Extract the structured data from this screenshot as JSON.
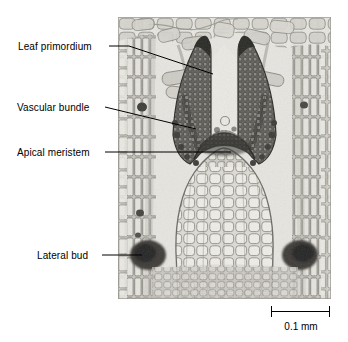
{
  "figure": {
    "kind": "light-micrograph",
    "background_color": "#ffffff",
    "label_color": "#000000",
    "leader_color": "#000000"
  },
  "micrograph": {
    "alt": "grayscale longitudinal section of a plant shoot tip showing meristem, leaf primordia and lateral buds",
    "tone_light": "#e6e5e0",
    "tone_mid": "#a9a8a2",
    "tone_dark": "#4c4b47",
    "tone_darkest": "#2b2a27"
  },
  "labels": [
    {
      "id": "leaf-primordium",
      "text": "Leaf primordium"
    },
    {
      "id": "vascular-bundle",
      "text": "Vascular bundle"
    },
    {
      "id": "apical-meristem",
      "text": "Apical meristem"
    },
    {
      "id": "lateral-bud",
      "text": "Lateral bud"
    }
  ],
  "scale_bar": {
    "label": "0.1 mm",
    "value": 0.1,
    "unit": "mm",
    "bar_length_px": 59
  }
}
